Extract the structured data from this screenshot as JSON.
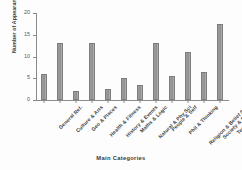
{
  "chart_data": {
    "type": "bar",
    "title": "",
    "xlabel": "Main Categories",
    "ylabel": "Number of Appearance",
    "categories": [
      "General Ref.",
      "Culture & Arts",
      "Geo & Places",
      "Health & Fitness",
      "History & Events",
      "Maths & Logic",
      "Natural & Phy Sci",
      "People & Self",
      "Phil & Thinking",
      "Religion & Belief Sys",
      "Society & Soc Sci",
      "Tech & App Sci"
    ],
    "values": [
      6,
      13,
      2,
      13,
      2.5,
      5,
      3.5,
      13,
      5.5,
      11,
      6.5,
      17.5
    ],
    "ylim": [
      0,
      20
    ],
    "yticks": [
      0,
      5,
      10,
      15,
      20
    ],
    "ytick_labels": [
      "0",
      "5",
      "10",
      "15",
      "20"
    ],
    "grid": false,
    "legend": false,
    "bar_color": "#9a9a9a",
    "axis_color": "#8a8a8a"
  }
}
